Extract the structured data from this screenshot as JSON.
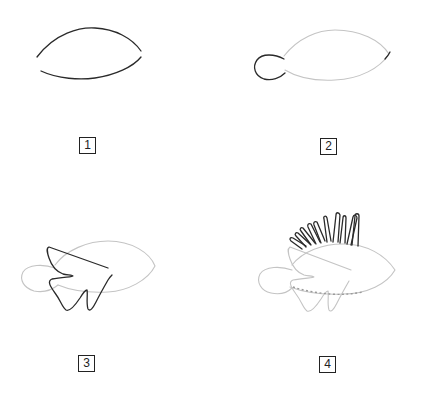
{
  "steps": [
    {
      "number": "1",
      "description": "Body outline arcs"
    },
    {
      "number": "2",
      "description": "Add tail and mouth"
    },
    {
      "number": "3",
      "description": "Add dorsal, pectoral and pelvic fins"
    },
    {
      "number": "4",
      "description": "Add venomous dorsal spines and lateral line"
    }
  ],
  "colors": {
    "ink": "#2a2a2a",
    "guide": "#c4c4c4",
    "background": "#ffffff"
  }
}
